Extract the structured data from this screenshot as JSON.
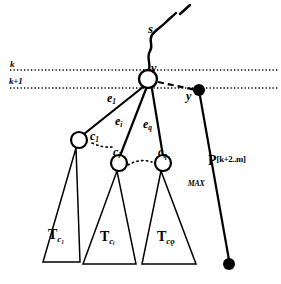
{
  "figure": {
    "ink_color": "#000000",
    "background": "#ffffff"
  },
  "levels": [
    {
      "id": "k",
      "label": "k",
      "line_y": 70,
      "style": "dotted"
    },
    {
      "id": "k+1",
      "label": "k+1",
      "line_y": 88,
      "style": "dotted"
    }
  ],
  "nodes": {
    "root": {
      "label": "v",
      "shape": "circle-open",
      "x": 148,
      "y": 79
    },
    "child1": {
      "label": "c",
      "sub": "1",
      "shape": "circle-open",
      "x": 79,
      "y": 140
    },
    "child_i": {
      "label": "c",
      "sub": "i",
      "shape": "circle-open",
      "x": 119,
      "y": 163
    },
    "child_q": {
      "label": "c",
      "sub": "q",
      "shape": "circle-open",
      "x": 163,
      "y": 163
    },
    "dot_top": {
      "label": "y",
      "shape": "circle-filled",
      "x": 199,
      "y": 90
    },
    "dot_bottom": {
      "label": "",
      "shape": "circle-filled",
      "x": 229,
      "y": 264
    }
  },
  "edges": [
    {
      "id": "e1",
      "label": "e",
      "sub": "1"
    },
    {
      "id": "ei",
      "label": "e",
      "sub": "i"
    },
    {
      "id": "eq",
      "label": "e",
      "sub": "q"
    }
  ],
  "squiggle": {
    "label": "s",
    "tick_mark": "'"
  },
  "triangles": [
    {
      "id": "T_c1",
      "label": "T",
      "sub": "c1",
      "sub_display": "c₁"
    },
    {
      "id": "T_ci",
      "label": "T",
      "sub": "ci",
      "sub_display": "cᵢ"
    },
    {
      "id": "T_cq",
      "label": "T",
      "sub": "cq",
      "sub_display": "cǫ"
    }
  ],
  "path_label": {
    "base": "P",
    "superscript": "[k+2..m]",
    "subscript": "MAX"
  },
  "ellipses": [
    {
      "id": "ellipsis-upper",
      "between": [
        "c1",
        "ei"
      ]
    },
    {
      "id": "ellipsis-lower",
      "between": [
        "ci",
        "cq"
      ]
    }
  ]
}
